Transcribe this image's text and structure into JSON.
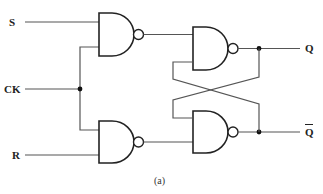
{
  "diagram": {
    "caption": "(a)",
    "inputs": {
      "s_label": "S",
      "ck_label": "CK",
      "r_label": "R"
    },
    "outputs": {
      "q_label": "Q",
      "qbar_label": "Q"
    },
    "gates": [
      {
        "id": "nand-s",
        "type": "NAND",
        "inputs": [
          "S",
          "CK"
        ],
        "output": "to nand-q"
      },
      {
        "id": "nand-r",
        "type": "NAND",
        "inputs": [
          "CK",
          "R"
        ],
        "output": "to nand-qbar"
      },
      {
        "id": "nand-q",
        "type": "NAND",
        "inputs": [
          "nand-s",
          "Q-bar feedback"
        ],
        "output": "Q"
      },
      {
        "id": "nand-qbar",
        "type": "NAND",
        "inputs": [
          "Q feedback",
          "nand-r"
        ],
        "output": "Q-bar"
      }
    ],
    "colors": {
      "wire": "#555555",
      "gate_outline": "#222222",
      "junction": "#111111",
      "background": "#ffffff"
    }
  }
}
